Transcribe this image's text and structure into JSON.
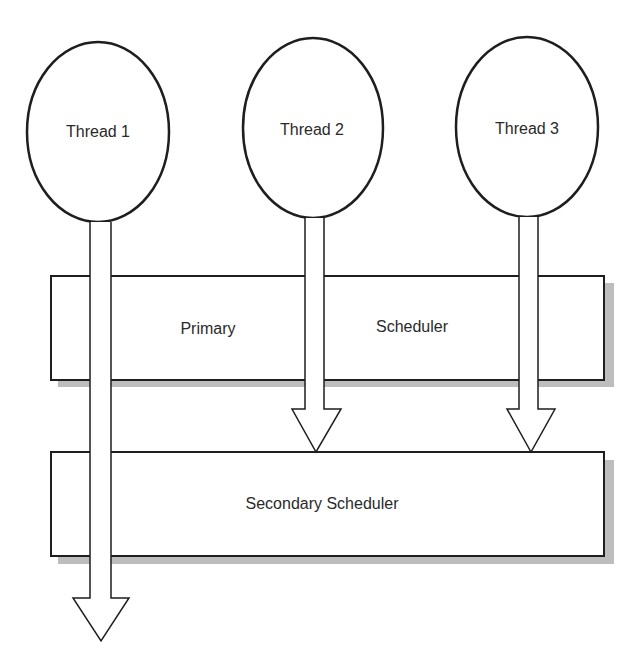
{
  "diagram": {
    "threads": [
      {
        "label": "Thread 1"
      },
      {
        "label": "Thread 2"
      },
      {
        "label": "Thread 3"
      }
    ],
    "primary_scheduler": {
      "label_left": "Primary",
      "label_right": "Scheduler"
    },
    "secondary_scheduler": {
      "label": "Secondary Scheduler"
    },
    "colors": {
      "stroke": "#1e1e1e",
      "shadow": "#bdbdbd",
      "fill": "#ffffff"
    }
  }
}
